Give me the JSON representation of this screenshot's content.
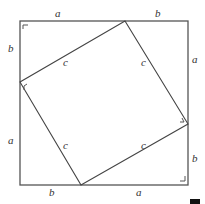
{
  "diagram": {
    "outer_square": {
      "x1": 20,
      "y1": 21,
      "x2": 188,
      "y2": 185
    },
    "inner_square": {
      "vertices": [
        [
          125,
          21
        ],
        [
          188,
          124
        ],
        [
          81,
          185
        ],
        [
          20,
          82
        ]
      ]
    },
    "labels": {
      "top_a": "a",
      "top_b": "b",
      "right_a": "a",
      "right_b": "b",
      "bottom_b": "b",
      "bottom_a": "a",
      "left_b": "b",
      "left_a": "a",
      "c_top_left": "c",
      "c_top_right": "c",
      "c_bottom_left": "c",
      "c_bottom_right": "c"
    },
    "colors": {
      "line": "#555555",
      "text": "#333333",
      "marker": "#111111"
    }
  }
}
